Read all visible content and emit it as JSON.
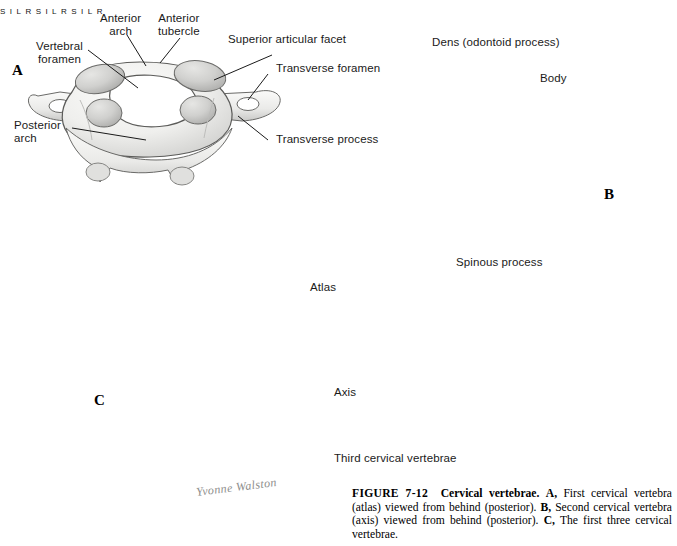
{
  "figure": {
    "number": "FIGURE 7-12",
    "title": "Cervical vertebrae.",
    "caption_a_marker": "A,",
    "caption_a": " First cervical vertebra (atlas) viewed from behind (posterior). ",
    "caption_b_marker": "B,",
    "caption_b": " Second cervical vertebra (axis) viewed from behind (posterior). ",
    "caption_c_marker": "C,",
    "caption_c": " The first three cervical vertebrae.",
    "artist_signature": "Yvonne Walston"
  },
  "panels": {
    "a": {
      "letter": "A",
      "subject": "First cervical vertebra (atlas), posterior view"
    },
    "b": {
      "letter": "B",
      "subject": "Second cervical vertebra (axis), posterior view"
    },
    "c": {
      "letter": "C",
      "subject": "First three cervical vertebrae"
    }
  },
  "labels": {
    "vertebral_foramen_l1": "Vertebral",
    "vertebral_foramen_l2": "foramen",
    "anterior_arch_l1": "Anterior",
    "anterior_arch_l2": "arch",
    "anterior_tubercle_l1": "Anterior",
    "anterior_tubercle_l2": "tubercle",
    "superior_articular_facet": "Superior articular facet",
    "transverse_foramen": "Transverse foramen",
    "transverse_process": "Transverse process",
    "posterior_arch_l1": "Posterior",
    "posterior_arch_l2": "arch",
    "dens": "Dens (odontoid process)",
    "body": "Body",
    "spinous_process": "Spinous process",
    "atlas": "Atlas",
    "axis": "Axis",
    "third_cervical_vertebrae": "Third cervical vertebrae"
  },
  "orientation_rose": {
    "superior": "S",
    "inferior": "I",
    "left": "L",
    "right": "R"
  },
  "colors": {
    "bone_light": "#f4f4f2",
    "bone_mid": "#e2e2e0",
    "bone_shadow": "#c6c6c4",
    "bone_deep": "#a9a9a7",
    "outline": "#5b5b59",
    "arrow": "#3d3d3d",
    "text": "#1a1a1a"
  }
}
